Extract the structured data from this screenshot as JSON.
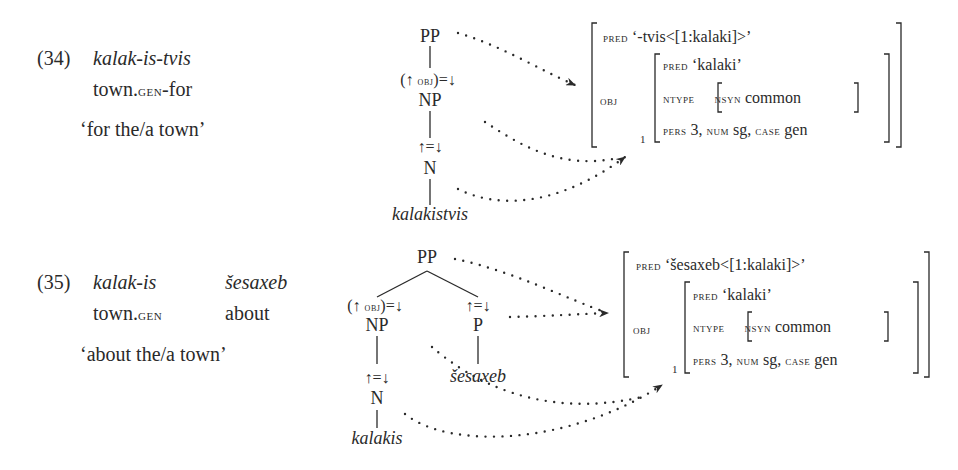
{
  "examples": [
    {
      "number": "(34)",
      "form": "kalak-is-tvis",
      "gloss": {
        "word": "town.",
        "case": "gen",
        "suffix": "-for"
      },
      "translation": "‘for the/a town’",
      "cstructure": {
        "root": "PP",
        "obj_annotation": {
          "open": "(↑ ",
          "fn": "obj",
          "close": ")=↓"
        },
        "np": "NP",
        "head_annotation": "↑=↓",
        "n": "N",
        "terminal": "kalakistvis"
      },
      "fstructure": {
        "pred_attr": "pred",
        "pred_value": "‘-tvis<[1:kalaki]>’",
        "obj_attr": "obj",
        "obj": {
          "pred_attr": "pred",
          "pred_value": "‘kalaki’",
          "ntype_attr": "ntype",
          "nsyn_attr": "nsyn",
          "nsyn_value": "common",
          "pers_attr": "pers",
          "pers_value": "3,",
          "num_attr": "num",
          "num_value": "sg,",
          "case_attr": "case",
          "case_value": "gen",
          "index": "1"
        }
      }
    },
    {
      "number": "(35)",
      "form": "kalak-is",
      "form2": "šesaxeb",
      "gloss": {
        "word": "town.",
        "case": "gen",
        "word2": "about"
      },
      "translation": "‘about the/a town’",
      "cstructure": {
        "root": "PP",
        "obj_annotation": {
          "open": "(↑ ",
          "fn": "obj",
          "close": ")=↓"
        },
        "np": "NP",
        "p_annotation": "↑=↓",
        "p": "P",
        "p_terminal": "šesaxeb",
        "head_annotation": "↑=↓",
        "n": "N",
        "terminal": "kalakis"
      },
      "fstructure": {
        "pred_attr": "pred",
        "pred_value": "‘šesaxeb<[1:kalaki]>’",
        "obj_attr": "obj",
        "obj": {
          "pred_attr": "pred",
          "pred_value": "‘kalaki’",
          "ntype_attr": "ntype",
          "nsyn_attr": "nsyn",
          "nsyn_value": "common",
          "pers_attr": "pers",
          "pers_value": "3,",
          "num_attr": "num",
          "num_value": "sg,",
          "case_attr": "case",
          "case_value": "gen",
          "index": "1"
        }
      }
    }
  ],
  "colors": {
    "ink": "#2a2a2a",
    "background": "#ffffff"
  }
}
